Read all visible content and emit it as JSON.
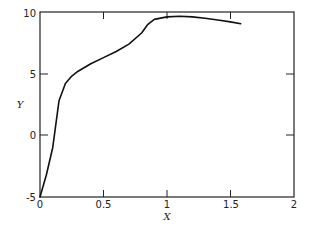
{
  "chart_data": {
    "type": "line",
    "title": "",
    "xlabel": "X",
    "ylabel": "Y",
    "xlim": [
      0,
      2
    ],
    "ylim": [
      -5,
      10
    ],
    "xticks": [
      "0",
      "0.5",
      "1",
      "1.5",
      "2"
    ],
    "yticks": [
      "-5",
      "0",
      "5",
      "10"
    ],
    "grid": false,
    "legend": null,
    "series": [
      {
        "name": "Y(X)",
        "x": [
          0.0,
          0.05,
          0.1,
          0.12,
          0.15,
          0.2,
          0.25,
          0.3,
          0.4,
          0.5,
          0.6,
          0.7,
          0.8,
          0.85,
          0.9,
          1.0,
          1.1,
          1.2,
          1.3,
          1.4,
          1.5,
          1.58
        ],
        "y": [
          -5.0,
          -3.2,
          -1.0,
          0.5,
          2.8,
          4.2,
          4.8,
          5.2,
          5.8,
          6.3,
          6.8,
          7.4,
          8.3,
          9.0,
          9.4,
          9.6,
          9.65,
          9.6,
          9.5,
          9.35,
          9.2,
          9.05
        ]
      }
    ]
  },
  "axes": {
    "x_label": "X",
    "y_label": "Y",
    "x_ticks": [
      "0",
      "0.5",
      "1",
      "1.5",
      "2"
    ],
    "y_ticks": [
      "-5",
      "0",
      "5",
      "10"
    ]
  }
}
